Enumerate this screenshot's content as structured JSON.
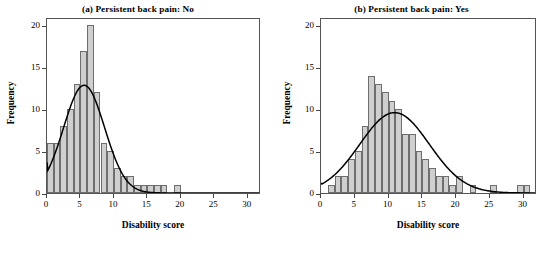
{
  "figure": {
    "background": "#ffffff",
    "bar_fill": "#cfcfcf",
    "bar_stroke": "#6e6e6e",
    "curve_color": "#000000",
    "axis_color": "#555555"
  },
  "panels": {
    "a": {
      "title": "(a) Persistent back pain: No",
      "xlabel": "Disability score",
      "ylabel": "Frequency",
      "xticks": [
        "0",
        "5",
        "10",
        "15",
        "20",
        "25",
        "30"
      ],
      "yticks": [
        "0",
        "5",
        "10",
        "15",
        "20"
      ]
    },
    "b": {
      "title": "(b) Persistent back pain: Yes",
      "xlabel": "Disability score",
      "ylabel": "Frequency",
      "xticks": [
        "0",
        "5",
        "10",
        "15",
        "20",
        "25",
        "30"
      ],
      "yticks": [
        "0",
        "5",
        "10",
        "15",
        "20"
      ]
    }
  },
  "chart_data": [
    {
      "type": "bar",
      "panel": "a",
      "title": "(a) Persistent back pain: No",
      "xlabel": "Disability score",
      "ylabel": "Frequency",
      "xlim": [
        0,
        32
      ],
      "ylim": [
        0,
        21
      ],
      "xticks": [
        0,
        5,
        10,
        15,
        20,
        25,
        30
      ],
      "yticks": [
        0,
        5,
        10,
        15,
        20
      ],
      "grid": false,
      "legend": null,
      "bin_width": 1,
      "bin_starts": [
        0,
        1,
        2,
        3,
        4,
        5,
        6,
        7,
        8,
        9,
        10,
        11,
        12,
        13,
        14,
        15,
        16,
        17,
        18,
        19
      ],
      "values": [
        6,
        6,
        8,
        10,
        13,
        17,
        20,
        12,
        6,
        5,
        3,
        2,
        2,
        1,
        1,
        1,
        1,
        1,
        0,
        1
      ],
      "overlay_curve": {
        "kind": "normal-density",
        "peak_y": 13.0,
        "peak_x": 5.6,
        "left_edge_y": 3.7,
        "spread": 3.1,
        "color": "#000000"
      }
    },
    {
      "type": "bar",
      "panel": "b",
      "title": "(b) Persistent back pain: Yes",
      "xlabel": "Disability score",
      "ylabel": "Frequency",
      "xlim": [
        0,
        32
      ],
      "ylim": [
        0,
        21
      ],
      "xticks": [
        0,
        5,
        10,
        15,
        20,
        25,
        30
      ],
      "yticks": [
        0,
        5,
        10,
        15,
        20
      ],
      "grid": false,
      "legend": null,
      "bin_width": 1,
      "bin_starts": [
        1,
        2,
        3,
        4,
        5,
        6,
        7,
        8,
        9,
        10,
        11,
        12,
        13,
        14,
        15,
        16,
        17,
        18,
        19,
        20,
        21,
        22,
        25,
        29,
        30
      ],
      "values": [
        1,
        2,
        2,
        4,
        5,
        8,
        14,
        13,
        12,
        11,
        10,
        7,
        7,
        5,
        4,
        3,
        2,
        2,
        1,
        2,
        0,
        1,
        1,
        1,
        1
      ],
      "overlay_curve": {
        "kind": "normal-density",
        "peak_y": 9.7,
        "peak_x": 11.0,
        "left_edge_y": 1.2,
        "spread": 5.2,
        "color": "#000000"
      }
    }
  ]
}
